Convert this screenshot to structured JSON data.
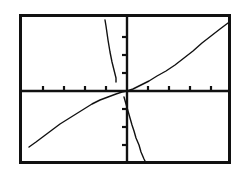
{
  "screen": {
    "title": "Graphing Calculator Screen",
    "background_color": "#ffffff",
    "ink_color": "#111111",
    "width": 242,
    "height": 176
  },
  "frame": {
    "name": "viewport-border",
    "x": 19,
    "y": 14,
    "width": 212,
    "height": 150,
    "stroke_width": 3,
    "color": "#111111"
  },
  "chart_data": {
    "type": "line",
    "title": "",
    "xlabel": "",
    "ylabel": "",
    "grid": false,
    "legend": false,
    "axis_style": "calculator-ticks",
    "origin_px": {
      "x": 127,
      "y": 91
    },
    "px_per_unit_x": 21,
    "px_per_unit_y": 18,
    "xlim": [
      -5.1,
      4.95
    ],
    "ylim": [
      -4.05,
      4.3
    ],
    "x_ticks": [
      -4,
      -3,
      -2,
      -1,
      1,
      2,
      3,
      4
    ],
    "y_ticks": [
      -3,
      -2,
      -1,
      1,
      2,
      3
    ],
    "tick_len_px": 5,
    "axes": {
      "x_axis": {
        "name": "x-axis",
        "y_px": 91,
        "x_start_px": 21,
        "x_end_px": 229
      },
      "y_axis": {
        "name": "y-axis",
        "x_px": 127,
        "y_start_px": 16,
        "y_end_px": 162
      }
    },
    "series": [
      {
        "name": "increasing-root-curve",
        "label": "Y1",
        "color": "#111111",
        "stroke_width": 1.4,
        "points_px": [
          [
            29,
            147
          ],
          [
            36,
            142
          ],
          [
            44,
            136
          ],
          [
            52,
            130
          ],
          [
            60,
            124
          ],
          [
            68,
            119
          ],
          [
            76,
            114
          ],
          [
            84,
            109
          ],
          [
            92,
            104
          ],
          [
            100,
            100
          ],
          [
            108,
            97
          ],
          [
            116,
            94
          ],
          [
            122,
            92
          ],
          [
            127,
            91
          ],
          [
            133,
            89
          ],
          [
            141,
            85
          ],
          [
            149,
            81
          ],
          [
            157,
            76
          ],
          [
            166,
            71
          ],
          [
            175,
            65
          ],
          [
            184,
            58
          ],
          [
            193,
            51
          ],
          [
            202,
            43
          ],
          [
            211,
            36
          ],
          [
            220,
            29
          ],
          [
            228,
            23
          ]
        ]
      },
      {
        "name": "steep-curve-upper-branch",
        "label": "Y2-upper",
        "color": "#111111",
        "stroke_width": 1.4,
        "points_px": [
          [
            105,
            20
          ],
          [
            106,
            26
          ],
          [
            107,
            33
          ],
          [
            108,
            40
          ],
          [
            109,
            46
          ],
          [
            110,
            52
          ],
          [
            111,
            57
          ],
          [
            112,
            62
          ],
          [
            113,
            66
          ],
          [
            114,
            70
          ],
          [
            115,
            74
          ],
          [
            116,
            78
          ],
          [
            116,
            82
          ]
        ]
      },
      {
        "name": "steep-curve-lower-branch",
        "label": "Y2-lower",
        "color": "#111111",
        "stroke_width": 1.4,
        "points_px": [
          [
            124,
            97
          ],
          [
            126,
            104
          ],
          [
            128,
            111
          ],
          [
            130,
            118
          ],
          [
            132,
            125
          ],
          [
            134,
            131
          ],
          [
            136,
            138
          ],
          [
            139,
            145
          ],
          [
            141,
            152
          ],
          [
            144,
            159
          ],
          [
            146,
            163
          ]
        ]
      }
    ]
  }
}
